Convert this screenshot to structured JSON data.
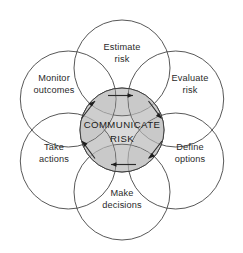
{
  "diagram": {
    "center": {
      "label_line1": "COMMUNICATE",
      "label_line2": "RISK",
      "fill_color": "#c4c4c4",
      "stroke_color": "#3a3a3a"
    },
    "background_color": "#ffffff",
    "petals": [
      {
        "id": "estimate-risk",
        "label_line1": "Estimate",
        "label_line2": "risk",
        "position": "top",
        "angle_deg": -90
      },
      {
        "id": "evaluate-risk",
        "label_line1": "Evaluate",
        "label_line2": "risk",
        "position": "top-right",
        "angle_deg": -30
      },
      {
        "id": "define-options",
        "label_line1": "Define",
        "label_line2": "options",
        "position": "bottom-right",
        "angle_deg": 30
      },
      {
        "id": "make-decisions",
        "label_line1": "Make",
        "label_line2": "decisions",
        "position": "bottom",
        "angle_deg": 90
      },
      {
        "id": "take-actions",
        "label_line1": "Take",
        "label_line2": "actions",
        "position": "bottom-left",
        "angle_deg": 150
      },
      {
        "id": "monitor-outcomes",
        "label_line1": "Monitor",
        "label_line2": "outcomes",
        "position": "top-left",
        "angle_deg": 210
      }
    ],
    "arrows": [
      {
        "id": "arrow-top",
        "direction": "right",
        "flow": "clockwise"
      },
      {
        "id": "arrow-top-right",
        "direction": "down-right",
        "flow": "clockwise"
      },
      {
        "id": "arrow-bottom-right",
        "direction": "down-left",
        "flow": "clockwise"
      },
      {
        "id": "arrow-bottom",
        "direction": "left",
        "flow": "clockwise"
      },
      {
        "id": "arrow-bottom-left",
        "direction": "up-left",
        "flow": "clockwise"
      },
      {
        "id": "arrow-top-left",
        "direction": "up-right",
        "flow": "clockwise"
      }
    ]
  }
}
